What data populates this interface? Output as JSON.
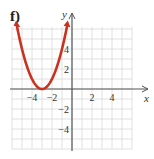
{
  "panel_label": "f)",
  "chart_data": {
    "type": "line",
    "title": "",
    "function": "y = (x + 3)^2",
    "xlabel": "x",
    "ylabel": "y",
    "xlim": [
      -6,
      6
    ],
    "ylim": [
      -6,
      6.2
    ],
    "grid": true,
    "x_ticks": [
      -4,
      -2,
      2,
      4
    ],
    "y_ticks": [
      -4,
      -2,
      2,
      4
    ],
    "x_tick_labels": [
      "−4",
      "−2",
      "2",
      "4"
    ],
    "y_tick_labels": [
      "−4",
      "−2",
      "2",
      "4"
    ],
    "series": [
      {
        "name": "parabola",
        "color": "#c8321e",
        "x": [
          -5.5,
          -5,
          -4.5,
          -4,
          -3.5,
          -3,
          -2.5,
          -2,
          -1.5,
          -1,
          -0.5
        ],
        "y": [
          6.25,
          4,
          2.25,
          1,
          0.25,
          0,
          0.25,
          1,
          2.25,
          4,
          6.25
        ],
        "arrows": "both-ends"
      }
    ],
    "vertex": [
      -3,
      0
    ]
  },
  "colors": {
    "curve": "#c8321e",
    "axis": "#555555",
    "grid": "#d8d8d8"
  }
}
